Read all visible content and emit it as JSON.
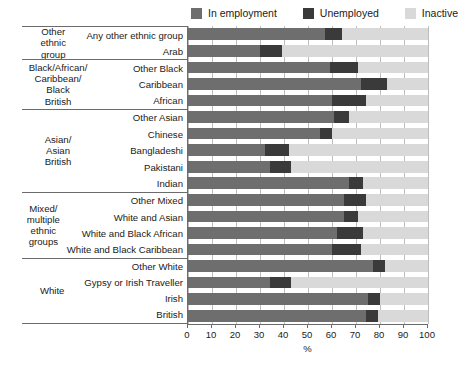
{
  "legend": {
    "items": [
      {
        "label": "In employment",
        "color": "#6e6e6e",
        "key": "employment"
      },
      {
        "label": "Unemployed",
        "color": "#3a3a3a",
        "key": "unemployed"
      },
      {
        "label": "Inactive",
        "color": "#d9d9d9",
        "key": "inactive"
      }
    ]
  },
  "axis": {
    "title": "%",
    "ticks": [
      "0",
      "10",
      "20",
      "30",
      "40",
      "50",
      "60",
      "70",
      "80",
      "90",
      "100"
    ]
  },
  "chart_data": {
    "type": "bar",
    "orientation": "horizontal",
    "stacked": true,
    "title": "",
    "xlabel": "%",
    "ylabel": "",
    "xlim": [
      0,
      100
    ],
    "grid": true,
    "legend_position": "top-right",
    "series": [
      {
        "name": "In employment",
        "color": "#6e6e6e"
      },
      {
        "name": "Unemployed",
        "color": "#3a3a3a"
      },
      {
        "name": "Inactive",
        "color": "#d9d9d9"
      }
    ],
    "groups": [
      {
        "group": "Other ethnic group",
        "rows": [
          {
            "category": "Any other ethnic group",
            "employment": 57,
            "unemployed": 7,
            "inactive": 36
          },
          {
            "category": "Arab",
            "employment": 30,
            "unemployed": 9,
            "inactive": 61
          }
        ]
      },
      {
        "group": "Black/African/ Caribbean/ Black British",
        "rows": [
          {
            "category": "Other Black",
            "employment": 59,
            "unemployed": 12,
            "inactive": 29
          },
          {
            "category": "Caribbean",
            "employment": 72,
            "unemployed": 11,
            "inactive": 17
          },
          {
            "category": "African",
            "employment": 60,
            "unemployed": 14,
            "inactive": 26
          }
        ]
      },
      {
        "group": "Asian/ Asian British",
        "rows": [
          {
            "category": "Other Asian",
            "employment": 61,
            "unemployed": 6,
            "inactive": 33
          },
          {
            "category": "Chinese",
            "employment": 55,
            "unemployed": 5,
            "inactive": 40
          },
          {
            "category": "Bangladeshi",
            "employment": 32,
            "unemployed": 10,
            "inactive": 58
          },
          {
            "category": "Pakistani",
            "employment": 34,
            "unemployed": 9,
            "inactive": 57
          },
          {
            "category": "Indian",
            "employment": 67,
            "unemployed": 6,
            "inactive": 27
          }
        ]
      },
      {
        "group": "Mixed/ multiple ethnic groups",
        "rows": [
          {
            "category": "Other Mixed",
            "employment": 65,
            "unemployed": 9,
            "inactive": 26
          },
          {
            "category": "White and Asian",
            "employment": 65,
            "unemployed": 6,
            "inactive": 29
          },
          {
            "category": "White and Black African",
            "employment": 62,
            "unemployed": 11,
            "inactive": 27
          },
          {
            "category": "White and Black Caribbean",
            "employment": 60,
            "unemployed": 12,
            "inactive": 28
          }
        ]
      },
      {
        "group": "White",
        "rows": [
          {
            "category": "Other White",
            "employment": 77,
            "unemployed": 5,
            "inactive": 18
          },
          {
            "category": "Gypsy or Irish Traveller",
            "employment": 34,
            "unemployed": 9,
            "inactive": 57
          },
          {
            "category": "Irish",
            "employment": 75,
            "unemployed": 5,
            "inactive": 20
          },
          {
            "category": "British",
            "employment": 74,
            "unemployed": 5,
            "inactive": 21
          }
        ]
      }
    ]
  }
}
